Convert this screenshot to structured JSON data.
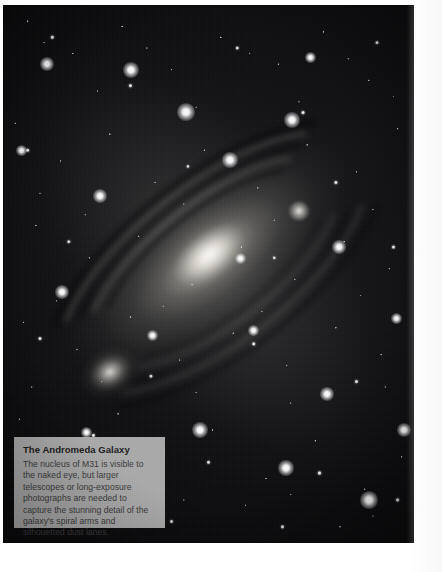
{
  "page": {
    "background_color": "#ffffff",
    "kind": "printed-page-astrophotograph"
  },
  "photo": {
    "subject": "The Andromeda Galaxy (M31)",
    "background_color": "#050507",
    "features": [
      {
        "name": "galaxy-nucleus",
        "label": "M31 nucleus"
      },
      {
        "name": "spiral-arms",
        "label": "spiral arms"
      },
      {
        "name": "dust-lanes",
        "label": "silhouetted dust lanes"
      },
      {
        "name": "satellite-galaxy-m110",
        "label": "M110"
      },
      {
        "name": "satellite-galaxy-m32",
        "label": "M32"
      },
      {
        "name": "star-field",
        "label": "foreground stars"
      }
    ],
    "bright_stars": [
      {
        "x": 131,
        "y": 70,
        "size": 7
      },
      {
        "x": 47,
        "y": 64,
        "size": 6
      },
      {
        "x": 186,
        "y": 112,
        "size": 8
      },
      {
        "x": 292,
        "y": 120,
        "size": 7
      },
      {
        "x": 230,
        "y": 160,
        "size": 7
      },
      {
        "x": 100,
        "y": 196,
        "size": 6
      },
      {
        "x": 339,
        "y": 247,
        "size": 6
      },
      {
        "x": 62,
        "y": 292,
        "size": 6
      },
      {
        "x": 200,
        "y": 430,
        "size": 7
      },
      {
        "x": 286,
        "y": 468,
        "size": 7
      },
      {
        "x": 369,
        "y": 500,
        "size": 8
      },
      {
        "x": 404,
        "y": 430,
        "size": 6
      },
      {
        "x": 152,
        "y": 335,
        "size": 5
      },
      {
        "x": 253,
        "y": 330,
        "size": 5
      },
      {
        "x": 327,
        "y": 394,
        "size": 6
      },
      {
        "x": 86,
        "y": 432,
        "size": 5
      },
      {
        "x": 396,
        "y": 318,
        "size": 5
      },
      {
        "x": 21,
        "y": 150,
        "size": 5
      },
      {
        "x": 310,
        "y": 57,
        "size": 5
      },
      {
        "x": 240,
        "y": 258,
        "size": 5
      }
    ]
  },
  "caption": {
    "title": "The Andromeda Galaxy",
    "body": "The nucleus of M31 is visible to the naked eye, but larger telescopes or long-exposure photographs are needed to capture the stunning detail of the galaxy's spiral arms and silhouetted dust lanes.",
    "background_color": "#aaaaaa",
    "title_color": "#1b1b1b",
    "body_color": "#3a3a3a"
  }
}
